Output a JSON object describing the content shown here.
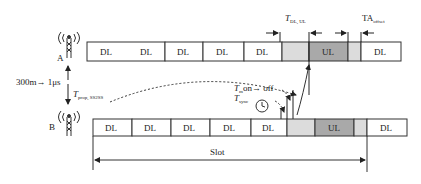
{
  "stations": {
    "a": {
      "label": "A"
    },
    "b": {
      "label": "B"
    }
  },
  "distance_label": "300m→ 1μs",
  "prop_label": {
    "main": "T",
    "sub": "prop, SS2SS"
  },
  "top_row": [
    {
      "type": "DL",
      "label": "DL",
      "label2": "DL"
    },
    {
      "type": "DL",
      "label": "DL"
    },
    {
      "type": "DL",
      "label": "DL"
    },
    {
      "type": "DL",
      "label": "DL"
    },
    {
      "type": "gap",
      "label": ""
    },
    {
      "type": "UL",
      "label": "UL"
    },
    {
      "type": "gap",
      "label": ""
    },
    {
      "type": "DL",
      "label": "DL"
    }
  ],
  "bottom_row": [
    {
      "type": "DL",
      "label": "DL"
    },
    {
      "type": "DL",
      "label": "DL"
    },
    {
      "type": "DL",
      "label": "DL"
    },
    {
      "type": "DL",
      "label": "DL"
    },
    {
      "type": "DL",
      "label": "DL"
    },
    {
      "type": "gap",
      "label": ""
    },
    {
      "type": "UL",
      "label": "UL"
    },
    {
      "type": "gap",
      "label": ""
    },
    {
      "type": "DL",
      "label": "DL"
    }
  ],
  "annotations": {
    "t_dl_ul": {
      "main": "T",
      "sub": "DL, UL"
    },
    "ta_offset": {
      "main": "TA",
      "sub": "offset"
    },
    "t_m": {
      "main": "T",
      "sub": "m",
      "text": "on→ off"
    },
    "t_sync": {
      "main": "T",
      "sub": "sync"
    },
    "slot": "Slot"
  },
  "colors": {
    "dl_fill": "#ffffff",
    "gap_fill": "#dcdcdc",
    "ul_fill": "#a9a9a9",
    "stroke": "#333333"
  }
}
